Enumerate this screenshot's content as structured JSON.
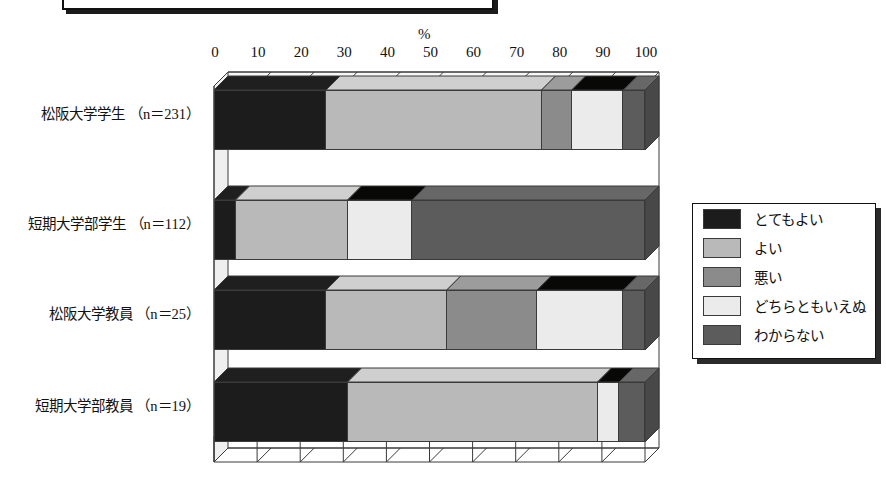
{
  "axis": {
    "unit_label": "%",
    "ticks": [
      "0",
      "10",
      "20",
      "30",
      "40",
      "50",
      "60",
      "70",
      "80",
      "90",
      "100"
    ]
  },
  "legend": {
    "items": [
      {
        "label": "とてもよい",
        "color": "#1c1c1c"
      },
      {
        "label": "よい",
        "color": "#b9b9b9"
      },
      {
        "label": "悪い",
        "color": "#8b8b8b"
      },
      {
        "label": "どちらともいえぬ",
        "color": "#ebebeb"
      },
      {
        "label": "わからない",
        "color": "#5c5c5c"
      }
    ]
  },
  "categories": [
    "松阪大学学生 （n＝231）",
    "短期大学部学生 （n＝112）",
    "松阪大学教員 （n＝25）",
    "短期大学部教員 （n＝19）"
  ],
  "chart_data": {
    "type": "bar",
    "orientation": "horizontal",
    "stacked": true,
    "percent": true,
    "title": "",
    "xlabel": "%",
    "ylabel": "",
    "xlim": [
      0,
      100
    ],
    "xticks": [
      0,
      10,
      20,
      30,
      40,
      50,
      60,
      70,
      80,
      90,
      100
    ],
    "grid": true,
    "legend_position": "right",
    "categories": [
      "松阪大学学生 （n＝231）",
      "短期大学部学生 （n＝112）",
      "松阪大学教員 （n＝25）",
      "短期大学部教員 （n＝19）"
    ],
    "series": [
      {
        "name": "とてもよい",
        "color": "#1c1c1c",
        "values": [
          26,
          5,
          26,
          31
        ]
      },
      {
        "name": "よい",
        "color": "#b9b9b9",
        "values": [
          50,
          26,
          28,
          58
        ]
      },
      {
        "name": "悪い",
        "color": "#8b8b8b",
        "values": [
          7,
          0,
          21,
          0
        ]
      },
      {
        "name": "どちらともいえぬ",
        "color": "#ebebeb",
        "values": [
          12,
          15,
          20,
          5
        ]
      },
      {
        "name": "わからない",
        "color": "#5c5c5c",
        "values": [
          5,
          54,
          5,
          6
        ]
      }
    ]
  }
}
